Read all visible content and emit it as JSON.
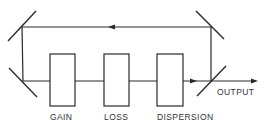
{
  "diagram": {
    "type": "ring laser cavity schematic",
    "components": [
      {
        "id": "gain",
        "label": "GAIN"
      },
      {
        "id": "loss",
        "label": "LOSS"
      },
      {
        "id": "dispersion",
        "label": "DISPERSION"
      }
    ],
    "output_label": "OUTPUT",
    "mirrors": [
      "top-left",
      "bottom-left",
      "top-right",
      "bottom-right (output coupler)"
    ],
    "beam_direction": "clockwise: left-to-right along bottom, right-to-left along top"
  }
}
